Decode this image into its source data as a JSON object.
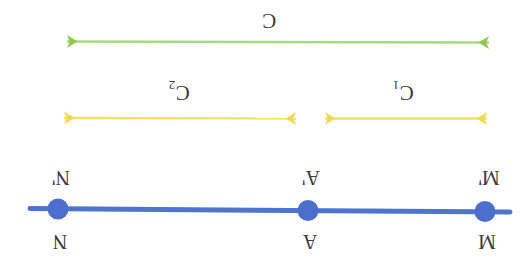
{
  "canvas": {
    "width": 528,
    "height": 270,
    "background": "#ffffff"
  },
  "orientation": {
    "rotation_degrees": 180,
    "note": "entire diagram appears upside-down"
  },
  "colors": {
    "green": "#8ACB4E",
    "green_line": "#A9D97F",
    "yellow": "#F5D94E",
    "yellow_line": "#F7DF6A",
    "blue": "#4F74CE",
    "blue_dot": "#4C6FCB",
    "text": "#3a3a3a"
  },
  "arrows": {
    "green": {
      "label": "C",
      "label_sub": "",
      "color": "#8ACB4E",
      "x_start": 55,
      "x_end": 500,
      "y": 42,
      "heads": "both",
      "data_name": "green-arrow-C"
    },
    "yellow_left": {
      "label": "C",
      "label_sub": "2",
      "color": "#F5D94E",
      "x_start": 52,
      "x_end": 307,
      "y": 118,
      "heads": "both",
      "data_name": "yellow-arrow-C2"
    },
    "yellow_right": {
      "label": "C",
      "label_sub": "1",
      "color": "#F5D94E",
      "x_start": 313,
      "x_end": 498,
      "y": 118,
      "heads": "both",
      "data_name": "yellow-arrow-C1"
    }
  },
  "number_line": {
    "color": "#4F74CE",
    "x_start": 30,
    "x_end": 510,
    "y": 210,
    "thickness": 5,
    "points": [
      {
        "id": "N",
        "x": 58,
        "label_below": "N",
        "label_above": "N'"
      },
      {
        "id": "A",
        "x": 308,
        "label_below": "A",
        "label_above": "A'"
      },
      {
        "id": "M",
        "x": 485,
        "label_below": "M",
        "label_above": "M'"
      }
    ]
  },
  "labels": {
    "C": "C",
    "C2_base": "C",
    "C2_sub": "2",
    "C1_base": "C",
    "C1_sub": "1",
    "N_prime": "N'",
    "A_prime": "A'",
    "M_prime": "M'",
    "N": "N",
    "A": "A",
    "M": "M"
  }
}
